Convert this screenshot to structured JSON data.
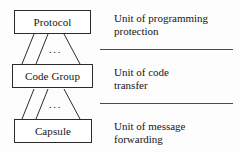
{
  "diagram": {
    "nodes": [
      {
        "id": "protocol",
        "label": "Protocol"
      },
      {
        "id": "code_group",
        "label": "Code Group"
      },
      {
        "id": "capsule",
        "label": "Capsule"
      }
    ],
    "connector_ellipsis": "...",
    "notes": [
      {
        "id": "protection",
        "line1": "Unit of programming",
        "line2": "protection"
      },
      {
        "id": "transfer",
        "line1": "Unit of code",
        "line2": "transfer"
      },
      {
        "id": "forwarding",
        "line1": "Unit of message",
        "line2": "forwarding"
      }
    ],
    "colors": {
      "background": "#fdfdfd",
      "stroke": "#2b2b2b",
      "divider": "#4a4a4a",
      "text": "#151515"
    }
  }
}
